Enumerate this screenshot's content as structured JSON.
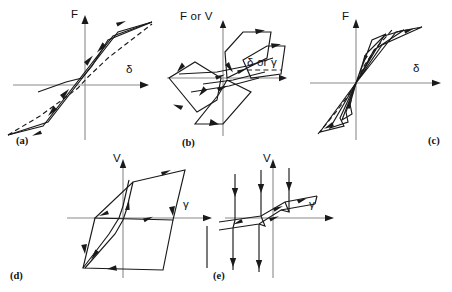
{
  "figure": {
    "background_color": "#ffffff",
    "line_color": "#1a1a1a",
    "axis_color": "#8a8a8a",
    "width": 452,
    "height": 292
  },
  "panels": [
    {
      "id": "a",
      "label": "(a)",
      "name": "panel-a-bilinear-hysteresis",
      "description": "Broad parallelogram hysteresis loop with dashed skeleton backbone curve",
      "y_axis_label": "F",
      "x_axis_label": "δ",
      "loop_type": "fat-bilinear",
      "has_dashed_backbone": true
    },
    {
      "id": "b",
      "label": "(b)",
      "name": "panel-b-stiffness-degrading-hysteresis",
      "description": "Nested offset parallelogram loops, S-shaped stiffness degradation with dashed segment",
      "y_axis_label": "F or V",
      "x_axis_label": "δ or γ",
      "loop_type": "stiffness-degrading",
      "has_dashed_backbone": true
    },
    {
      "id": "c",
      "label": "(c)",
      "name": "panel-c-pinched-origin-oriented-hysteresis",
      "description": "Narrow slender loops converging at the origin, origin-oriented pinched behaviour",
      "y_axis_label": "F",
      "x_axis_label": "δ",
      "loop_type": "origin-oriented-pinched",
      "has_dashed_backbone": true
    },
    {
      "id": "d",
      "label": "(d)",
      "name": "panel-d-shear-hysteresis",
      "description": "Large inclined parallelogram shear loop with inner narrow reloading branch",
      "y_axis_label": "V",
      "x_axis_label": "γ",
      "loop_type": "shear-parallelogram",
      "has_dashed_backbone": false
    },
    {
      "id": "e",
      "label": "(e)",
      "name": "panel-e-slip-hysteresis",
      "description": "Flat slip-type loop with vertical load drop segments and downward arrows",
      "y_axis_label": "V",
      "x_axis_label": "γ",
      "loop_type": "slip-type",
      "has_dashed_backbone": false
    }
  ]
}
